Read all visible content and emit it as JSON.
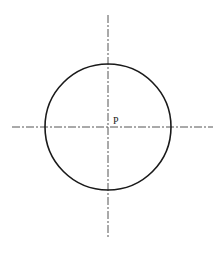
{
  "diagram": {
    "type": "circle-with-centerlines",
    "center": {
      "x": 108,
      "y": 127
    },
    "radius": 63,
    "point_label": "P",
    "stroke_color": "#1a1a1a",
    "centerline_color": "#555555",
    "horizontal_centerline": {
      "x1": 12,
      "x2": 213
    },
    "vertical_centerline": {
      "y1": 15,
      "y2": 238
    }
  }
}
